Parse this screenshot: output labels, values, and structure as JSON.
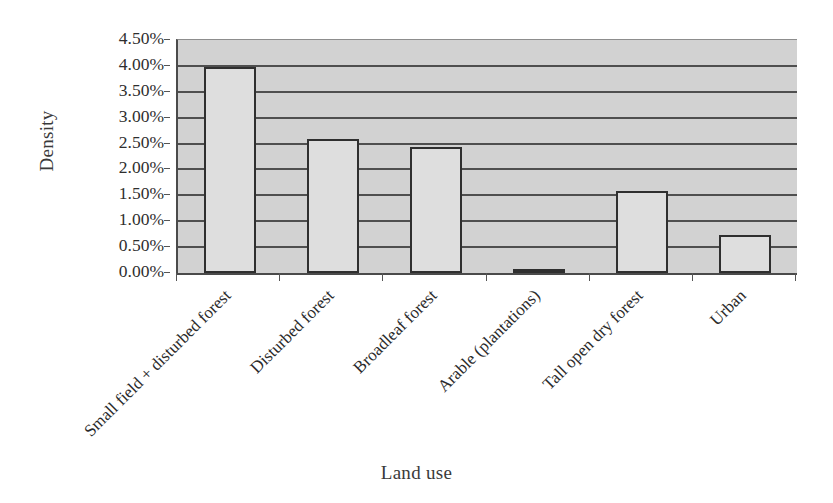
{
  "chart_data": {
    "type": "bar",
    "title": "",
    "xlabel": "Land use",
    "ylabel": "Density",
    "categories": [
      "Small field + disturbed forest",
      "Disturbed forest",
      "Broadleaf forest",
      "Arable (plantations)",
      "Tall open dry forest",
      "Urban"
    ],
    "values": [
      3.97,
      2.58,
      2.44,
      0.02,
      1.58,
      0.73
    ],
    "value_labels": [
      "3.97%",
      "2.58%",
      "2.44%",
      "0.02%",
      "1.58%",
      "0.73%"
    ],
    "ylim": [
      0,
      4.5
    ],
    "ytick_values": [
      0.0,
      0.5,
      1.0,
      1.5,
      2.0,
      2.5,
      3.0,
      3.5,
      4.0,
      4.5
    ],
    "ytick_labels": [
      "0.00%",
      "0.50%",
      "1.00%",
      "1.50%",
      "2.00%",
      "2.50%",
      "3.00%",
      "3.50%",
      "4.00%",
      "4.50%"
    ],
    "grid": true,
    "grid_orientation": "horizontal",
    "legend": false,
    "legend_position": "none",
    "series": [
      {
        "name": "Density",
        "values": [
          3.97,
          2.58,
          2.44,
          0.02,
          1.58,
          0.73
        ]
      }
    ],
    "colors": {
      "page_background": "#ffffff",
      "plot_background": "#d2d2d2",
      "gridline": "#4f4f4f",
      "bar_fill": "#dedede",
      "bar_outline": "#2f2f2f",
      "axis_line": "#4a4a4a",
      "text": "#2b2b2b"
    },
    "x_label_rotation_deg": -45
  }
}
